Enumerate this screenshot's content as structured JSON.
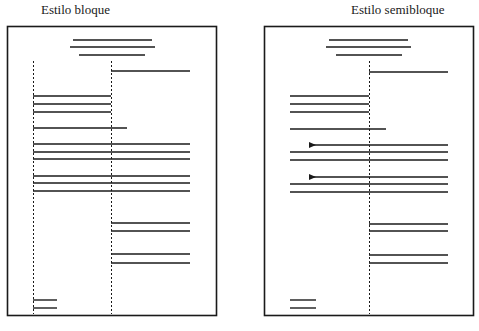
{
  "diagrams": [
    {
      "title": "Estilo bloque",
      "style": "block",
      "indent_markers": false,
      "sections": [
        "heading",
        "inside-address",
        "greeting",
        "body-paragraph-1",
        "body-paragraph-2",
        "closing",
        "signature",
        "initials"
      ]
    },
    {
      "title": "Estilo semibloque",
      "style": "semiblock",
      "indent_markers": true,
      "sections": [
        "heading",
        "inside-address",
        "greeting",
        "body-paragraph-1",
        "body-paragraph-2",
        "closing",
        "signature",
        "initials"
      ]
    }
  ],
  "colors": {
    "line": "#1a1a1a",
    "page_border": "#2a2a2a",
    "background": "#ffffff"
  }
}
